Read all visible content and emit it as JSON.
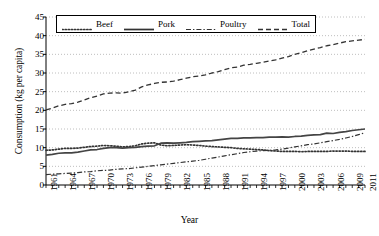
{
  "chart_data": {
    "type": "line",
    "title": "",
    "xlabel": "Year",
    "ylabel": "Consumption (kg per capita)",
    "xlim": [
      1961,
      2011
    ],
    "ylim": [
      0,
      45
    ],
    "ytick_step": 5,
    "yticks": [
      0,
      5,
      10,
      15,
      20,
      25,
      30,
      35,
      40,
      45
    ],
    "xticks": [
      1961,
      1964,
      1967,
      1970,
      1973,
      1976,
      1979,
      1982,
      1985,
      1988,
      1991,
      1994,
      1997,
      2000,
      2003,
      2006,
      2009,
      2011
    ],
    "xtick_labels": [
      "1961",
      "1964",
      "1967",
      "1970",
      "1973",
      "1976",
      "1979",
      "1982",
      "1985",
      "1988",
      "1991",
      "1994",
      "1997",
      "2000",
      "2003",
      "2006",
      "2009",
      "2011"
    ],
    "ytick_labels": [
      "0",
      "5",
      "10",
      "15",
      "20",
      "25",
      "30",
      "35",
      "40",
      "45"
    ],
    "grid": "horizontal-dotted",
    "legend_position": "top-left-inside",
    "x": [
      1961,
      1962,
      1963,
      1964,
      1965,
      1966,
      1967,
      1968,
      1969,
      1970,
      1971,
      1972,
      1973,
      1974,
      1975,
      1976,
      1977,
      1978,
      1979,
      1980,
      1981,
      1982,
      1983,
      1984,
      1985,
      1986,
      1987,
      1988,
      1989,
      1990,
      1991,
      1992,
      1993,
      1994,
      1995,
      1996,
      1997,
      1998,
      1999,
      2000,
      2001,
      2002,
      2003,
      2004,
      2005,
      2006,
      2007,
      2008,
      2009,
      2010,
      2011
    ],
    "series": [
      {
        "name": "Beef",
        "style": "dotted",
        "color": "#333333",
        "values": [
          9.3,
          9.4,
          9.6,
          9.8,
          9.8,
          9.9,
          10.1,
          10.3,
          10.4,
          10.6,
          10.5,
          10.4,
          10.2,
          10.3,
          10.5,
          11.0,
          11.2,
          11.3,
          10.7,
          10.5,
          10.6,
          10.7,
          10.8,
          10.7,
          10.6,
          10.4,
          10.3,
          10.2,
          10.1,
          10.0,
          9.8,
          9.7,
          9.6,
          9.5,
          9.4,
          9.2,
          9.1,
          9.0,
          9.0,
          9.0,
          8.9,
          9.0,
          9.0,
          9.0,
          9.0,
          9.1,
          9.1,
          9.1,
          9.0,
          9.0,
          9.0
        ]
      },
      {
        "name": "Pork",
        "style": "solid",
        "color": "#444444",
        "values": [
          8.0,
          8.2,
          8.5,
          8.6,
          8.6,
          8.8,
          9.1,
          9.4,
          9.5,
          9.8,
          10.0,
          10.0,
          9.9,
          10.0,
          10.1,
          10.3,
          10.4,
          10.5,
          11.2,
          11.3,
          11.2,
          11.3,
          11.4,
          11.6,
          11.7,
          11.8,
          11.9,
          12.1,
          12.3,
          12.5,
          12.5,
          12.6,
          12.6,
          12.7,
          12.7,
          12.8,
          12.8,
          12.9,
          12.8,
          13.0,
          13.1,
          13.3,
          13.4,
          13.5,
          13.9,
          13.8,
          14.1,
          14.3,
          14.6,
          14.8,
          15.0
        ]
      },
      {
        "name": "Poultry",
        "style": "dashdot",
        "color": "#333333",
        "values": [
          2.8,
          2.9,
          3.0,
          3.1,
          3.2,
          3.3,
          3.5,
          3.6,
          3.8,
          3.9,
          4.0,
          4.2,
          4.3,
          4.4,
          4.6,
          4.8,
          5.0,
          5.2,
          5.4,
          5.6,
          5.8,
          6.0,
          6.2,
          6.4,
          6.6,
          6.9,
          7.2,
          7.5,
          7.8,
          8.1,
          8.4,
          8.7,
          8.9,
          9.1,
          9.2,
          9.3,
          9.4,
          9.6,
          9.9,
          10.2,
          10.5,
          10.8,
          11.0,
          11.3,
          11.6,
          11.9,
          12.2,
          12.6,
          13.0,
          13.5,
          14.0
        ]
      },
      {
        "name": "Total",
        "style": "dashed",
        "color": "#333333",
        "values": [
          20.1,
          20.6,
          21.2,
          21.6,
          21.8,
          22.2,
          22.8,
          23.4,
          23.8,
          24.4,
          24.6,
          24.7,
          24.6,
          25.0,
          25.4,
          26.3,
          26.8,
          27.2,
          27.5,
          27.6,
          27.8,
          28.2,
          28.6,
          29.0,
          29.2,
          29.5,
          30.0,
          30.4,
          30.9,
          31.4,
          31.6,
          32.1,
          32.3,
          32.6,
          32.9,
          33.2,
          33.5,
          34.0,
          34.4,
          35.0,
          35.4,
          36.0,
          36.4,
          36.8,
          37.3,
          37.6,
          38.0,
          38.4,
          38.6,
          38.8,
          39.0
        ]
      }
    ]
  },
  "legend": {
    "items": [
      {
        "label": "Beef",
        "style": "dotted"
      },
      {
        "label": "Pork",
        "style": "solid"
      },
      {
        "label": "Poultry",
        "style": "dashdot"
      },
      {
        "label": "Total",
        "style": "dashed"
      }
    ]
  }
}
